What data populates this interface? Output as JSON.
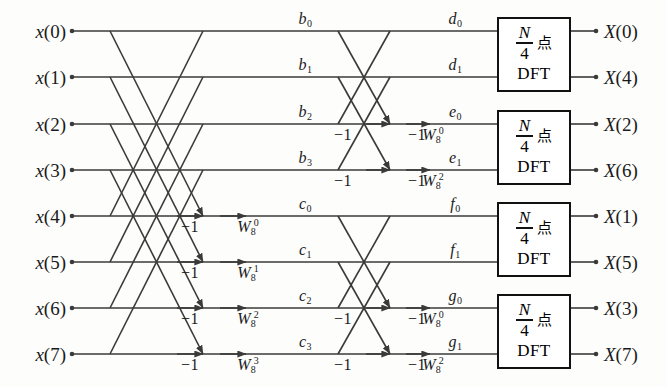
{
  "canvas": {
    "width": 667,
    "height": 387,
    "background": "#fdfdfc"
  },
  "style": {
    "line_color": "#3a3a3a",
    "text_color": "#1a1a1a",
    "box_border_color": "#111111",
    "line_width": 1.6,
    "box_border_width": 2.5
  },
  "geometry": {
    "rows_y": [
      31,
      77,
      124,
      170,
      216,
      262,
      308,
      354
    ],
    "x_input_dot": 72,
    "x_stage1_start": 110,
    "x_stage1_arrow_neg": 203,
    "x_stage1_arrow_tw": 246,
    "x_stage2_start": 338,
    "x_stage2_arrow_neg": 390,
    "x_stage2_arrow_tw": 430,
    "x_box_left": 497,
    "x_box_right": 571,
    "x_output_dot": 596,
    "x_mid_label_b": 305,
    "x_mid_label_c": 305,
    "x_mid_label_d": 455,
    "box_height": 75
  },
  "inputs": [
    {
      "name": "x",
      "index": "0",
      "label": "x(0)",
      "row": 0
    },
    {
      "name": "x",
      "index": "1",
      "label": "x(1)",
      "row": 1
    },
    {
      "name": "x",
      "index": "2",
      "label": "x(2)",
      "row": 2
    },
    {
      "name": "x",
      "index": "3",
      "label": "x(3)",
      "row": 3
    },
    {
      "name": "x",
      "index": "4",
      "label": "x(4)",
      "row": 4
    },
    {
      "name": "x",
      "index": "5",
      "label": "x(5)",
      "row": 5
    },
    {
      "name": "x",
      "index": "6",
      "label": "x(6)",
      "row": 6
    },
    {
      "name": "x",
      "index": "7",
      "label": "x(7)",
      "row": 7
    }
  ],
  "outputs": [
    {
      "name": "X",
      "index": "0",
      "label": "X(0)",
      "row": 0
    },
    {
      "name": "X",
      "index": "4",
      "label": "X(4)",
      "row": 1
    },
    {
      "name": "X",
      "index": "2",
      "label": "X(2)",
      "row": 2
    },
    {
      "name": "X",
      "index": "6",
      "label": "X(6)",
      "row": 3
    },
    {
      "name": "X",
      "index": "1",
      "label": "X(1)",
      "row": 4
    },
    {
      "name": "X",
      "index": "5",
      "label": "X(5)",
      "row": 5
    },
    {
      "name": "X",
      "index": "3",
      "label": "X(3)",
      "row": 6
    },
    {
      "name": "X",
      "index": "7",
      "label": "X(7)",
      "row": 7
    }
  ],
  "stage1": {
    "span_rows": 4,
    "butterflies": [
      {
        "top_row": 0,
        "bottom_row": 4,
        "twiddle_exp": "0"
      },
      {
        "top_row": 1,
        "bottom_row": 5,
        "twiddle_exp": "1"
      },
      {
        "top_row": 2,
        "bottom_row": 6,
        "twiddle_exp": "2"
      },
      {
        "top_row": 3,
        "bottom_row": 7,
        "twiddle_exp": "3"
      }
    ],
    "gain_label": "−1",
    "twiddle_base": "W",
    "twiddle_sub": "8"
  },
  "stage2": {
    "span_rows": 2,
    "butterflies": [
      {
        "top_row": 0,
        "bottom_row": 2,
        "twiddle_exp": "0"
      },
      {
        "top_row": 1,
        "bottom_row": 3,
        "twiddle_exp": "2"
      },
      {
        "top_row": 4,
        "bottom_row": 6,
        "twiddle_exp": "0"
      },
      {
        "top_row": 5,
        "bottom_row": 7,
        "twiddle_exp": "2"
      }
    ],
    "gain_label": "−1",
    "twiddle_base": "W",
    "twiddle_sub": "8"
  },
  "intermediate_labels": {
    "after_stage1": [
      {
        "text": "b",
        "sub": "0",
        "row": 0
      },
      {
        "text": "b",
        "sub": "1",
        "row": 1
      },
      {
        "text": "b",
        "sub": "2",
        "row": 2
      },
      {
        "text": "b",
        "sub": "3",
        "row": 3
      },
      {
        "text": "c",
        "sub": "0",
        "row": 4
      },
      {
        "text": "c",
        "sub": "1",
        "row": 5
      },
      {
        "text": "c",
        "sub": "2",
        "row": 6
      },
      {
        "text": "c",
        "sub": "3",
        "row": 7
      }
    ],
    "after_stage2": [
      {
        "text": "d",
        "sub": "0",
        "row": 0
      },
      {
        "text": "d",
        "sub": "1",
        "row": 1
      },
      {
        "text": "e",
        "sub": "0",
        "row": 2
      },
      {
        "text": "e",
        "sub": "1",
        "row": 3
      },
      {
        "text": "f",
        "sub": "0",
        "row": 4
      },
      {
        "text": "f",
        "sub": "1",
        "row": 5
      },
      {
        "text": "g",
        "sub": "0",
        "row": 6
      },
      {
        "text": "g",
        "sub": "1",
        "row": 7
      }
    ]
  },
  "dft_blocks": [
    {
      "id": "dft-block-1",
      "num": "N",
      "den": "4",
      "cjk": "点",
      "bottom": "DFT",
      "rows": [
        0,
        1
      ]
    },
    {
      "id": "dft-block-2",
      "num": "N",
      "den": "4",
      "cjk": "点",
      "bottom": "DFT",
      "rows": [
        2,
        3
      ]
    },
    {
      "id": "dft-block-3",
      "num": "N",
      "den": "4",
      "cjk": "点",
      "bottom": "DFT",
      "rows": [
        4,
        5
      ]
    },
    {
      "id": "dft-block-4",
      "num": "N",
      "den": "4",
      "cjk": "点",
      "bottom": "DFT",
      "rows": [
        6,
        7
      ]
    }
  ]
}
